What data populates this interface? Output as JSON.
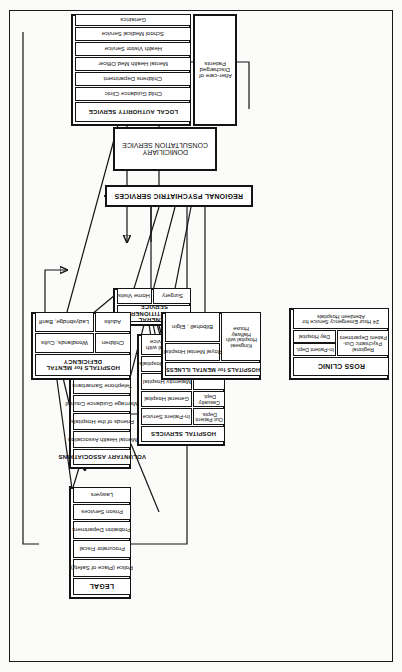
{
  "diagram": {
    "type": "flowchart",
    "orientation": "rotated-90-ccw",
    "title_node": "PATIENT",
    "nodes": {
      "patient": {
        "label": "PATIENT"
      },
      "legal": {
        "header": "LEGAL",
        "items": [
          "Police (Place of Safety)",
          "Procurator Fiscal",
          "Probation  Department",
          "Prison  Services",
          "Lawyers"
        ]
      },
      "voluntary": {
        "header": "VOLUNTARY ASSOCIATIONS",
        "items": [
          "Mental  Health  Association",
          "Friends of the  Hospitals",
          "Marriage Guidance Council",
          "Telephone  Samaritans",
          "Society for Mentally Handicapped Children"
        ]
      },
      "hospital_services": {
        "header": "HOSPITAL  SERVICES",
        "pairs": [
          {
            "left": "Out Patient Depts.",
            "right": "In-Patient Service"
          },
          {
            "left": "",
            "right": "General Hospital"
          },
          {
            "left": "Casualty Dept.",
            "right": "Maternity Hospital"
          },
          {
            "left": "",
            "right": "Peripheral Hospitals"
          },
          {
            "left": "Suicide' Service",
            "right": "Sick Childrens Hospital with Child Psychiatric Service"
          }
        ]
      },
      "gp": {
        "header": "GENERAL  PRACTITIONER SERVICE",
        "items": [
          "Surgery",
          "Home Visits"
        ]
      },
      "local_authority": {
        "header": "LOCAL  AUTHORITY SERVICE",
        "items": [
          "Child Guidance Clinic",
          "Childrens  Department",
          "Mental Health Med.Officer",
          "Health  Visitor  Service",
          "School  Medical  Service",
          "Geriatrics",
          "After-care of Discharged Patients"
        ]
      },
      "regional": {
        "label": "REGIONAL  PSYCHIATRIC   SERVICES"
      },
      "domiciliary": {
        "label": "DOMICILIARY CONSULTATION SERVICE"
      },
      "ross_clinic": {
        "header": "ROSS  CLINIC",
        "main": "Regional Psychiatric Out-Patient Department",
        "sub": [
          "In-Patient Dept.",
          "Day Hospital"
        ],
        "emergency": "24 Hour Emergency Service for Aberdeen Hospitals"
      },
      "mental_illness": {
        "header": "HOSPITALS for MENTAL ILLNESS",
        "main": "Kingseat Hospital with Halfway House",
        "sub": [
          "Royal Mental Hospital",
          "Bilbohall , Elgin"
        ]
      },
      "mental_deficiency": {
        "header": "HOSPITALS for  MENTAL DEFICIENCY",
        "rows": [
          {
            "left": "Children",
            "right": "Woodlands, Cults"
          },
          {
            "left": "Adults",
            "right": "Ladysbridge, Banff"
          }
        ]
      }
    },
    "colors": {
      "ink": "#141414",
      "paper": "#fbfbfa"
    }
  }
}
